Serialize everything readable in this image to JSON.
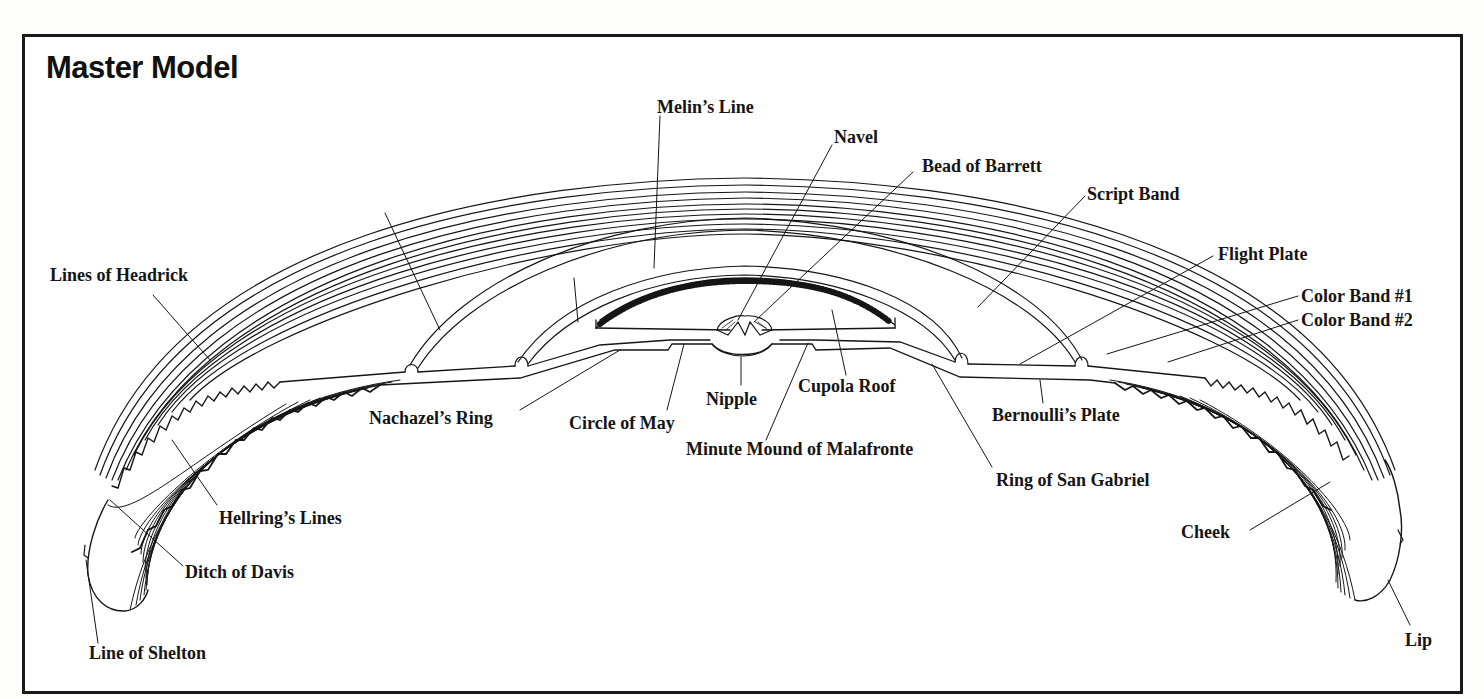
{
  "title": "Master Model",
  "labels": {
    "melins_line": "Melin’s Line",
    "navel": "Navel",
    "bead_of_barrett": "Bead of Barrett",
    "script_band": "Script Band",
    "flight_plate": "Flight Plate",
    "color_band_1": "Color Band #1",
    "color_band_2": "Color Band #2",
    "lines_of_headrick": "Lines of Headrick",
    "nachazels_ring": "Nachazel’s Ring",
    "circle_of_may": "Circle of May",
    "nipple": "Nipple",
    "cupola_roof": "Cupola Roof",
    "minute_mound_of_malafronte": "Minute Mound of Malafronte",
    "bernoullis_plate": "Bernoulli’s Plate",
    "ring_of_san_gabriel": "Ring of San Gabriel",
    "hellrings_lines": "Hellring’s Lines",
    "ditch_of_davis": "Ditch of Davis",
    "line_of_shelton": "Line of Shelton",
    "cheek": "Cheek",
    "lip": "Lip"
  },
  "colors": {
    "ink": "#151515",
    "paper": "#ffffff"
  }
}
